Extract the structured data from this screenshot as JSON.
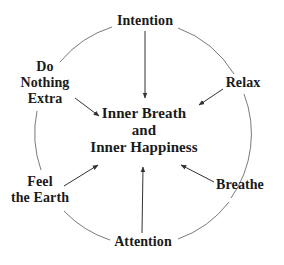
{
  "diagram": {
    "center": {
      "lines": [
        "Inner Breath",
        "and",
        "Inner Happiness"
      ]
    },
    "nodes": [
      {
        "id": "intention",
        "lines": [
          "Intention"
        ]
      },
      {
        "id": "relax",
        "lines": [
          "Relax"
        ]
      },
      {
        "id": "breathe",
        "lines": [
          "Breathe"
        ]
      },
      {
        "id": "attention",
        "lines": [
          "Attention"
        ]
      },
      {
        "id": "feel-the-earth",
        "lines": [
          "Feel",
          "the Earth"
        ]
      },
      {
        "id": "do-nothing-extra",
        "lines": [
          "Do",
          "Nothing",
          "Extra"
        ]
      }
    ],
    "edges": [
      {
        "from": "intention",
        "to": "center",
        "type": "arrow"
      },
      {
        "from": "relax",
        "to": "center",
        "type": "arrow"
      },
      {
        "from": "breathe",
        "to": "center",
        "type": "arrow"
      },
      {
        "from": "attention",
        "to": "center",
        "type": "arrow"
      },
      {
        "from": "feel-the-earth",
        "to": "center",
        "type": "arrow"
      },
      {
        "from": "do-nothing-extra",
        "to": "center",
        "type": "arrow"
      }
    ],
    "ring": "circle connecting outer nodes",
    "colors": {
      "text": "#1a1a1a",
      "lines": "#555555",
      "background": "#ffffff"
    }
  }
}
